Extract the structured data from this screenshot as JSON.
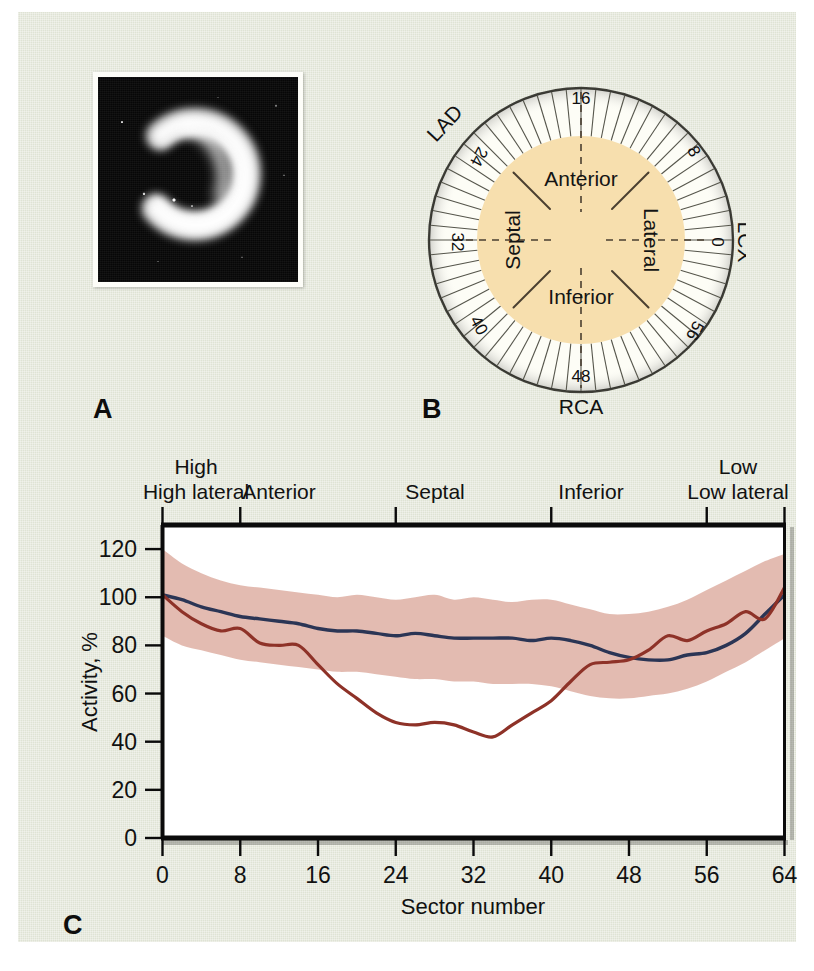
{
  "figure": {
    "background_color": "#dfe3d4",
    "panels": [
      {
        "id": "A",
        "label": "A",
        "kind": "spect-image",
        "description": "Short-axis SPECT myocardial perfusion image showing a bright crescent with an anteroseptal defect"
      },
      {
        "id": "B",
        "label": "B",
        "kind": "polar-sector-diagram"
      },
      {
        "id": "C",
        "label": "C",
        "kind": "line-chart"
      }
    ]
  },
  "panel_b": {
    "label": "B",
    "wall_labels": [
      "Anterior",
      "Septal",
      "Lateral",
      "Inferior"
    ],
    "artery_labels": [
      "LAD",
      "LCX",
      "RCA"
    ],
    "sector_ticks": [
      "0",
      "8",
      "16",
      "24",
      "32",
      "40",
      "48",
      "56"
    ],
    "total_sectors": 64,
    "inner_fill": "#f7dfae",
    "outer_fill": "#fdfdf6",
    "ring_stroke": "#4a4a42"
  },
  "chart_data": {
    "type": "line",
    "title": "",
    "xlabel": "Sector number",
    "ylabel": "Activity, %",
    "xlim": [
      0,
      64
    ],
    "ylim": [
      0,
      130
    ],
    "xticks": [
      0,
      8,
      16,
      24,
      32,
      40,
      48,
      56,
      64
    ],
    "yticks": [
      0,
      20,
      40,
      60,
      80,
      100,
      120
    ],
    "grid": false,
    "legend_position": "none",
    "region_labels": [
      "High lateral",
      "Anterior",
      "Septal",
      "Inferior",
      "Low lateral"
    ],
    "region_boundaries": [
      0,
      8,
      24,
      40,
      56,
      64
    ],
    "band": {
      "name": "Normal range",
      "color": "#e2b7ad",
      "x": [
        0,
        2,
        4,
        6,
        8,
        10,
        12,
        14,
        16,
        18,
        20,
        22,
        24,
        26,
        28,
        30,
        32,
        34,
        36,
        38,
        40,
        42,
        44,
        46,
        48,
        50,
        52,
        54,
        56,
        58,
        60,
        62,
        64
      ],
      "upper": [
        120,
        114,
        110,
        107,
        105,
        104,
        103,
        102,
        101,
        100,
        101,
        100,
        99,
        100,
        101,
        99,
        100,
        99,
        98,
        99,
        99,
        97,
        95,
        93,
        93,
        94,
        96,
        99,
        103,
        107,
        111,
        115,
        118
      ],
      "lower": [
        84,
        80,
        78,
        76,
        74,
        73,
        72,
        71,
        70,
        69,
        69,
        68,
        67,
        66,
        66,
        65,
        65,
        64,
        64,
        64,
        63,
        61,
        59,
        58,
        58,
        59,
        60,
        62,
        65,
        69,
        73,
        78,
        83
      ]
    },
    "series": [
      {
        "name": "Normal mean",
        "color": "#2b3555",
        "x": [
          0,
          2,
          4,
          6,
          8,
          10,
          12,
          14,
          16,
          18,
          20,
          22,
          24,
          26,
          28,
          30,
          32,
          34,
          36,
          38,
          40,
          42,
          44,
          46,
          48,
          50,
          52,
          54,
          56,
          58,
          60,
          62,
          64
        ],
        "values": [
          101,
          99,
          96,
          94,
          92,
          91,
          90,
          89,
          87,
          86,
          86,
          85,
          84,
          85,
          84,
          83,
          83,
          83,
          83,
          82,
          83,
          82,
          80,
          77,
          75,
          74,
          74,
          76,
          77,
          80,
          85,
          93,
          101
        ]
      },
      {
        "name": "Patient",
        "color": "#8e3228",
        "x": [
          0,
          2,
          4,
          6,
          8,
          10,
          12,
          14,
          16,
          18,
          20,
          22,
          24,
          26,
          28,
          30,
          32,
          34,
          36,
          38,
          40,
          42,
          44,
          46,
          48,
          50,
          52,
          54,
          56,
          58,
          60,
          62,
          64
        ],
        "values": [
          101,
          94,
          89,
          86,
          87,
          81,
          80,
          80,
          72,
          64,
          58,
          52,
          48,
          47,
          48,
          47,
          44,
          42,
          47,
          52,
          57,
          65,
          72,
          73,
          74,
          78,
          84,
          82,
          86,
          89,
          94,
          91,
          104
        ]
      }
    ]
  }
}
